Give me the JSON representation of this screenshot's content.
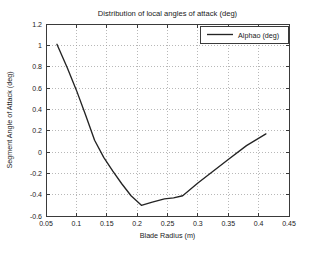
{
  "chart_data": {
    "type": "line",
    "title": "Distribution of local angles of attack (deg)",
    "xlabel": "Blade Radius (m)",
    "ylabel": "Segment Angle of Attack (deg)",
    "xlim": [
      0.05,
      0.45
    ],
    "ylim": [
      -0.6,
      1.2
    ],
    "grid": true,
    "legend_position": "top-right",
    "xticks": [
      "0.05",
      "0.1",
      "0.15",
      "0.2",
      "0.25",
      "0.3",
      "0.35",
      "0.4",
      "0.45"
    ],
    "xtick_values": [
      0.05,
      0.1,
      0.15,
      0.2,
      0.25,
      0.3,
      0.35,
      0.4,
      0.45
    ],
    "yticks": [
      "1.2",
      "1",
      "0.8",
      "0.6",
      "0.4",
      "0.2",
      "0",
      "-0.2",
      "-0.4",
      "-0.6"
    ],
    "ytick_values": [
      1.2,
      1.0,
      0.8,
      0.6,
      0.4,
      0.2,
      0.0,
      -0.2,
      -0.4,
      -0.6
    ],
    "series": [
      {
        "name": "Alphao (deg)",
        "color": "#242424",
        "x": [
          0.068,
          0.085,
          0.1,
          0.115,
          0.13,
          0.145,
          0.16,
          0.175,
          0.19,
          0.207,
          0.225,
          0.245,
          0.26,
          0.275,
          0.3,
          0.325,
          0.35,
          0.38,
          0.412
        ],
        "y": [
          1.01,
          0.79,
          0.58,
          0.35,
          0.11,
          -0.05,
          -0.18,
          -0.3,
          -0.41,
          -0.5,
          -0.47,
          -0.44,
          -0.43,
          -0.41,
          -0.29,
          -0.18,
          -0.07,
          0.06,
          0.17
        ]
      }
    ]
  },
  "legend": {
    "entries": [
      {
        "label": "Alphao (deg)"
      }
    ]
  }
}
